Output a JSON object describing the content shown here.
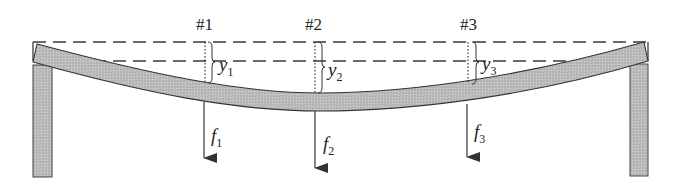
{
  "diagram": {
    "type": "simply-supported beam deflection",
    "colors": {
      "beam_fill": "#b9b9b9",
      "support_fill": "#b3b3b3",
      "stroke": "#333333",
      "dash": "#3a3a3a"
    },
    "points": [
      {
        "id": "1",
        "label": "#1",
        "deflection_symbol": "y",
        "deflection_sub": "1",
        "force_symbol": "f",
        "force_sub": "1"
      },
      {
        "id": "2",
        "label": "#2",
        "deflection_symbol": "y",
        "deflection_sub": "2",
        "force_symbol": "f",
        "force_sub": "2"
      },
      {
        "id": "3",
        "label": "#3",
        "deflection_symbol": "y",
        "deflection_sub": "3",
        "force_symbol": "f",
        "force_sub": "3"
      }
    ]
  }
}
